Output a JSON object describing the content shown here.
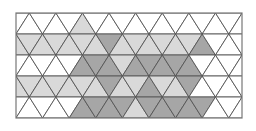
{
  "figure": {
    "type": "triangular-tessellation",
    "rect": {
      "x": 16,
      "y": 13,
      "width": 226,
      "height": 105
    },
    "rows": 5,
    "triangle_base": 26.6,
    "colors": {
      "0": "#ffffff",
      "1": "#d9d9d9",
      "2": "#a6a6a6",
      "stroke": "#555555",
      "border": "#777777"
    },
    "cells": [
      [
        0,
        0,
        0,
        0,
        0,
        1,
        0,
        0,
        0,
        0,
        0,
        0,
        0,
        0,
        0,
        0,
        0,
        0,
        0
      ],
      [
        1,
        1,
        1,
        1,
        1,
        1,
        1,
        2,
        1,
        1,
        1,
        1,
        1,
        1,
        2,
        0,
        0,
        0,
        0
      ],
      [
        0,
        0,
        0,
        0,
        0,
        2,
        2,
        2,
        1,
        2,
        2,
        2,
        2,
        2,
        0,
        0,
        0,
        0,
        0
      ],
      [
        1,
        1,
        1,
        1,
        1,
        1,
        1,
        2,
        1,
        1,
        2,
        1,
        1,
        2,
        0,
        0,
        0,
        0,
        0
      ],
      [
        0,
        0,
        0,
        0,
        0,
        2,
        2,
        2,
        2,
        1,
        2,
        2,
        2,
        2,
        2,
        0,
        0,
        0,
        0
      ]
    ]
  }
}
